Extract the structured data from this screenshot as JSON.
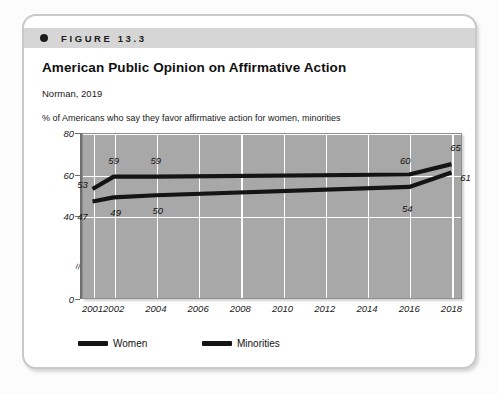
{
  "figure": {
    "label": "FIGURE 13.3",
    "title": "American Public Opinion on Affirmative Action",
    "source": "Norman, 2019",
    "axis_description": "% of Americans who say they favor affirmative action for women, minorities"
  },
  "chart_data": {
    "type": "line",
    "title": "American Public Opinion on Affirmative Action",
    "subtitle": "Norman, 2019",
    "xlabel": "",
    "ylabel": "% of Americans who say they favor affirmative action for women, minorities",
    "x": [
      2001,
      2002,
      2004,
      2016,
      2018
    ],
    "xlim": [
      2000.5,
      2018.5
    ],
    "ylim": [
      0,
      80
    ],
    "yticks": [
      0,
      40,
      60,
      80
    ],
    "ytick_labels": [
      "0",
      "40",
      "60",
      "80"
    ],
    "xticks": [
      2001,
      2002,
      2004,
      2006,
      2008,
      2010,
      2012,
      2014,
      2016,
      2018
    ],
    "xtick_labels": [
      "2001",
      "2002",
      "2004",
      "2006",
      "2008",
      "2010",
      "2012",
      "2014",
      "2016",
      "2018"
    ],
    "y_axis_break": true,
    "grid": true,
    "grid_color": "#ffffff",
    "plot_background": "#a8a8a8",
    "legend_position": "bottom",
    "series": [
      {
        "name": "Women",
        "color": "#141414",
        "x": [
          2001,
          2002,
          2004,
          2016,
          2018
        ],
        "values": [
          53,
          59,
          59,
          60,
          65
        ],
        "point_labels": [
          "53",
          "59",
          "59",
          "60",
          "65"
        ]
      },
      {
        "name": "Minorities",
        "color": "#141414",
        "x": [
          2001,
          2002,
          2004,
          2016,
          2018
        ],
        "values": [
          47,
          49,
          50,
          54,
          61
        ],
        "point_labels": [
          "47",
          "49",
          "50",
          "54",
          "61"
        ]
      }
    ]
  },
  "legend": [
    {
      "label": "Women"
    },
    {
      "label": "Minorities"
    }
  ]
}
